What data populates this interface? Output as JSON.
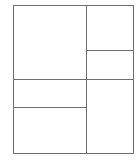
{
  "diagram": {
    "type": "rectangular-partition",
    "line_color": "#6e6e6e",
    "background": "#ffffff",
    "regions": [
      {
        "name": "top-left-large"
      },
      {
        "name": "top-right-upper"
      },
      {
        "name": "top-right-lower"
      },
      {
        "name": "bottom-left-upper"
      },
      {
        "name": "bottom-left-lower"
      },
      {
        "name": "bottom-right-tall"
      }
    ]
  }
}
